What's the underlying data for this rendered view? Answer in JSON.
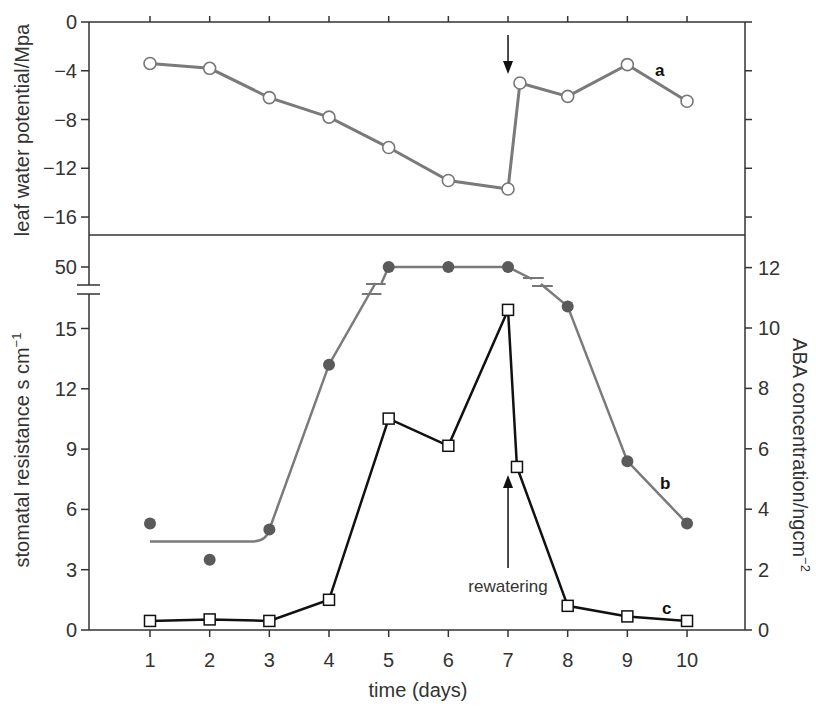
{
  "chart_data": [
    {
      "type": "line",
      "panel": "top",
      "ylabel": "leaf water potential/Mpa",
      "ylim": [
        -17.6,
        0
      ],
      "yticks": [
        0,
        -4,
        -8,
        -12,
        -16
      ],
      "ytick_labels": [
        "0",
        "−4",
        "−8",
        "−12",
        "−16"
      ],
      "series": [
        {
          "name": "a",
          "label": "a",
          "marker": "open-circle",
          "color": "#7a7a7a",
          "x": [
            1,
            2,
            3,
            4,
            5,
            6,
            7,
            7.2,
            8,
            9,
            10
          ],
          "y": [
            -3.4,
            -3.8,
            -6.2,
            -7.8,
            -10.3,
            -13.0,
            -13.7,
            -5.0,
            -6.1,
            -3.5,
            -6.5
          ]
        }
      ],
      "annotations": [
        {
          "type": "arrow-down",
          "x": 7,
          "label": ""
        }
      ]
    },
    {
      "type": "line",
      "panel": "bottom",
      "xlabel": "time (days)",
      "xticks": [
        1,
        2,
        3,
        4,
        5,
        6,
        7,
        8,
        9,
        10
      ],
      "xlim": [
        0,
        11
      ],
      "ylabel_left": "stomatal resistance s cm⁻¹",
      "ylabel_left_main": "stomatal resistance s cm",
      "ylabel_left_sup": "−1",
      "ylim_left": [
        0,
        17
      ],
      "yticks_left": [
        0,
        3,
        6,
        9,
        12,
        15
      ],
      "ytick_left_labels": [
        "0",
        "3",
        "6",
        "9",
        "12",
        "15"
      ],
      "ytick_left_break_label": "50",
      "ylabel_right": "ABA concentration/ng cm⁻²",
      "ylabel_right_main": "ABA concentration/ngcm",
      "ylabel_right_sup": "−2",
      "ylim_right": [
        0,
        12.2
      ],
      "yticks_right": [
        0,
        2,
        4,
        6,
        8,
        10,
        12
      ],
      "ytick_right_labels": [
        "0",
        "2",
        "4",
        "6",
        "8",
        "10",
        "12"
      ],
      "axis_break": "between 15 and 50 (stomatal resistance)",
      "series": [
        {
          "name": "b",
          "label": "b",
          "axis": "left",
          "marker": "filled-circle",
          "color": "#5a5a5a",
          "line_color": "#7a7a7a",
          "x": [
            1,
            2,
            3,
            4,
            5,
            6,
            7,
            8,
            9,
            10
          ],
          "y": [
            5.3,
            3.5,
            5.0,
            13.2,
            50,
            50,
            50,
            16.1,
            8.4,
            5.3
          ],
          "fit_curve_start_y": 4.4
        },
        {
          "name": "c",
          "label": "c",
          "axis": "right",
          "marker": "open-square",
          "color": "#111111",
          "x": [
            1,
            2,
            3,
            4,
            5,
            6,
            7,
            7.15,
            8,
            9,
            10
          ],
          "y": [
            0.3,
            0.35,
            0.3,
            1.0,
            7.0,
            6.1,
            10.6,
            5.4,
            0.8,
            0.45,
            0.3
          ]
        }
      ],
      "annotations": [
        {
          "type": "arrow-up",
          "x": 7,
          "label": "rewatering"
        }
      ]
    }
  ]
}
